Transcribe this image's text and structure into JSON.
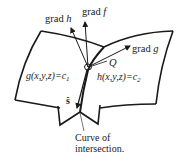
{
  "diagram": {
    "vectors": {
      "grad_h": {
        "prefix": "grad ",
        "var": "h"
      },
      "grad_f": {
        "prefix": "grad ",
        "var": "f"
      },
      "grad_g": {
        "prefix": "grad ",
        "var": "g"
      }
    },
    "point_label": "Q",
    "surface_g": {
      "expr": "g(x,y,z)=c",
      "sub": "1"
    },
    "surface_h": {
      "expr": "h(x,y,z)=c",
      "sub": "2"
    },
    "tangent_label": "ŝ",
    "curve_label": {
      "line1": "Curve of",
      "line2": "intersection."
    },
    "colors": {
      "line": "#1a1a1a",
      "text": "#222222",
      "background": "#ffffff"
    }
  }
}
